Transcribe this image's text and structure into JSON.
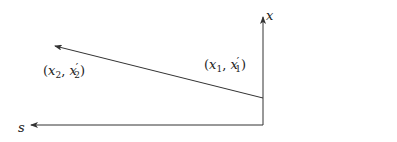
{
  "diagram": {
    "stroke_color": "#333333",
    "background": "#ffffff",
    "axes": {
      "vertical": {
        "label": "x",
        "from": [
          263,
          125
        ],
        "to": [
          263,
          17
        ]
      },
      "horizontal": {
        "label": "s",
        "from": [
          263,
          125
        ],
        "to": [
          31,
          125
        ]
      }
    },
    "vector": {
      "from": [
        263,
        98
      ],
      "to": [
        55,
        46
      ]
    },
    "points": {
      "p1": {
        "open": "(",
        "var": "x",
        "sub1": "1",
        "comma": ",",
        "var2": "x",
        "prime": "′",
        "sub2": "1",
        "close": ")"
      },
      "p2": {
        "open": "(",
        "var": "x",
        "sub1": "2",
        "comma": ",",
        "var2": "x",
        "prime": "′",
        "sub2": "2",
        "close": ")"
      }
    }
  }
}
